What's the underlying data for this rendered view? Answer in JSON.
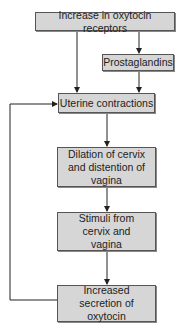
{
  "diagram": {
    "type": "flowchart",
    "nodes": [
      {
        "id": "receptors",
        "label": "Increase in oxytocin receptors"
      },
      {
        "id": "prostaglandins",
        "label": "Prostaglandins"
      },
      {
        "id": "contractions",
        "label": "Uterine contractions"
      },
      {
        "id": "dilation",
        "label": "Dilation of cervix and distention of vagina"
      },
      {
        "id": "stimuli",
        "label": "Stimuli from cervix and vagina"
      },
      {
        "id": "secretion",
        "label": "Increased secretion of oxytocin"
      }
    ],
    "edges": [
      {
        "from": "receptors",
        "to": "prostaglandins"
      },
      {
        "from": "receptors",
        "to": "contractions"
      },
      {
        "from": "prostaglandins",
        "to": "contractions"
      },
      {
        "from": "contractions",
        "to": "dilation"
      },
      {
        "from": "dilation",
        "to": "stimuli"
      },
      {
        "from": "stimuli",
        "to": "secretion"
      },
      {
        "from": "secretion",
        "to": "contractions",
        "kind": "feedback-loop"
      }
    ],
    "colors": {
      "box_fill": "#d6d6d6",
      "box_border": "#555555",
      "line": "#222222",
      "background": "#ffffff"
    }
  }
}
